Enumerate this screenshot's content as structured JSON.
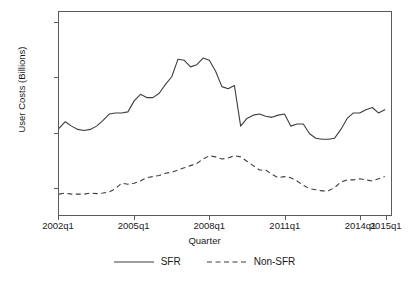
{
  "chart_data": {
    "type": "line",
    "title": "",
    "xlabel": "Quarter",
    "ylabel": "User Costs (Billions)",
    "xlim": [
      2002.0,
      2015.25
    ],
    "ylim": [
      250,
      2100
    ],
    "grid": false,
    "legend_position": "bottom-center",
    "x_tick_labels": [
      "2002q1",
      "2005q1",
      "2008q1",
      "2011q1",
      "2014q1",
      "2015q1"
    ],
    "x_tick_values": [
      2002.0,
      2005.0,
      2008.0,
      2011.0,
      2014.0,
      2015.0
    ],
    "y_tick_labels": [
      "500",
      "1000",
      "1500",
      "2000"
    ],
    "y_tick_values": [
      500,
      1000,
      1500,
      2000
    ],
    "x": [
      2002.0,
      2002.25,
      2002.5,
      2002.75,
      2003.0,
      2003.25,
      2003.5,
      2003.75,
      2004.0,
      2004.25,
      2004.5,
      2004.75,
      2005.0,
      2005.25,
      2005.5,
      2005.75,
      2006.0,
      2006.25,
      2006.5,
      2006.75,
      2007.0,
      2007.25,
      2007.5,
      2007.75,
      2008.0,
      2008.25,
      2008.5,
      2008.75,
      2009.0,
      2009.25,
      2009.5,
      2009.75,
      2010.0,
      2010.25,
      2010.5,
      2010.75,
      2011.0,
      2011.25,
      2011.5,
      2011.75,
      2012.0,
      2012.25,
      2012.5,
      2012.75,
      2013.0,
      2013.25,
      2013.5,
      2013.75,
      2014.0,
      2014.25,
      2014.5,
      2014.75,
      2015.0
    ],
    "series": [
      {
        "name": "SFR",
        "style": "solid",
        "color": "#3d3d3d",
        "values": [
          1040,
          1100,
          1060,
          1030,
          1020,
          1030,
          1060,
          1110,
          1170,
          1180,
          1180,
          1190,
          1290,
          1350,
          1320,
          1320,
          1360,
          1440,
          1510,
          1670,
          1660,
          1600,
          1620,
          1680,
          1660,
          1560,
          1420,
          1400,
          1430,
          1060,
          1130,
          1160,
          1170,
          1150,
          1140,
          1160,
          1170,
          1060,
          1080,
          1080,
          990,
          950,
          940,
          940,
          950,
          1030,
          1130,
          1180,
          1180,
          1210,
          1230,
          1180,
          1210
        ]
      },
      {
        "name": "Non-SFR",
        "style": "dashed",
        "color": "#3d3d3d",
        "values": [
          440,
          450,
          440,
          440,
          440,
          450,
          445,
          450,
          460,
          490,
          540,
          530,
          540,
          560,
          590,
          600,
          610,
          630,
          640,
          660,
          680,
          700,
          720,
          760,
          790,
          780,
          760,
          770,
          790,
          780,
          740,
          700,
          660,
          660,
          620,
          590,
          600,
          590,
          560,
          520,
          490,
          480,
          470,
          470,
          500,
          550,
          570,
          570,
          580,
          570,
          560,
          580,
          600
        ]
      }
    ]
  },
  "axes": {
    "y_label": "User Costs (Billions)",
    "x_label": "Quarter"
  },
  "legend": {
    "items": [
      {
        "label": "SFR",
        "style": "solid"
      },
      {
        "label": "Non-SFR",
        "style": "dashed"
      }
    ]
  }
}
